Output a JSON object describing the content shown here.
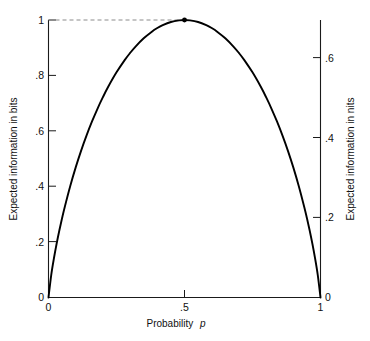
{
  "chart_data": {
    "type": "line",
    "title": "",
    "subtitle": "",
    "xlabel": "Probability p",
    "ylabel": "Expected information in bits",
    "y2label": "Expected information in nits",
    "xlim": [
      0,
      1
    ],
    "ylim": [
      0,
      1
    ],
    "y2lim": [
      0,
      0.6931
    ],
    "grid": false,
    "legend": null,
    "x_ticks": [
      {
        "value": 0,
        "label": "0"
      },
      {
        "value": 0.5,
        "label": ".5"
      },
      {
        "value": 1,
        "label": "1"
      }
    ],
    "y_ticks": [
      {
        "value": 0,
        "label": "0"
      },
      {
        "value": 0.2,
        "label": ".2"
      },
      {
        "value": 0.4,
        "label": ".4"
      },
      {
        "value": 0.6,
        "label": ".6"
      },
      {
        "value": 0.8,
        "label": ".8"
      },
      {
        "value": 1.0,
        "label": "1"
      }
    ],
    "y2_ticks": [
      {
        "value": 0,
        "label": "0"
      },
      {
        "value": 0.2,
        "label": ".2"
      },
      {
        "value": 0.4,
        "label": ".4"
      },
      {
        "value": 0.6,
        "label": ".6"
      }
    ],
    "series": [
      {
        "name": "Binary entropy H(p)",
        "x": [
          0.0,
          0.01,
          0.02,
          0.03,
          0.04,
          0.05,
          0.06,
          0.08,
          0.1,
          0.12,
          0.14,
          0.16,
          0.18,
          0.2,
          0.22,
          0.25,
          0.28,
          0.3,
          0.32,
          0.35,
          0.38,
          0.4,
          0.42,
          0.45,
          0.48,
          0.5,
          0.52,
          0.55,
          0.58,
          0.6,
          0.62,
          0.65,
          0.68,
          0.7,
          0.72,
          0.75,
          0.78,
          0.8,
          0.82,
          0.84,
          0.86,
          0.88,
          0.9,
          0.92,
          0.94,
          0.95,
          0.96,
          0.97,
          0.98,
          0.99,
          1.0
        ],
        "y": [
          0.0,
          0.0808,
          0.1414,
          0.1944,
          0.2423,
          0.2864,
          0.3274,
          0.4022,
          0.469,
          0.5294,
          0.5842,
          0.6343,
          0.6801,
          0.7219,
          0.7602,
          0.8113,
          0.8555,
          0.8813,
          0.9044,
          0.9341,
          0.958,
          0.971,
          0.9815,
          0.9928,
          0.9988,
          1.0,
          0.9988,
          0.9928,
          0.9815,
          0.971,
          0.958,
          0.9341,
          0.9044,
          0.8813,
          0.8555,
          0.8113,
          0.7602,
          0.7219,
          0.6801,
          0.6343,
          0.5842,
          0.5294,
          0.469,
          0.4022,
          0.3274,
          0.2864,
          0.2423,
          0.1944,
          0.1414,
          0.0808,
          0.0
        ]
      }
    ],
    "annotations": [
      {
        "name": "peak-marker",
        "x": 0.5,
        "y": 1.0,
        "label": ""
      },
      {
        "name": "peak-guide-line",
        "from": [
          0.0,
          1.0
        ],
        "to": [
          0.5,
          1.0
        ],
        "style": "dashed"
      }
    ]
  },
  "axes": {
    "left": {
      "title": "Expected information in bits",
      "tick_labels": [
        "0",
        ".2",
        ".4",
        ".6",
        ".8",
        "1"
      ]
    },
    "right": {
      "title": "Expected information in nits",
      "tick_labels": [
        "0",
        ".2",
        ".4",
        ".6"
      ]
    },
    "bottom": {
      "title_prefix": "Probability",
      "title_variable": "p",
      "tick_labels": [
        "0",
        ".5",
        "1"
      ]
    }
  },
  "colors": {
    "curve": "#000000",
    "axis": "#1a1a1a",
    "guide": "#8c8c8c",
    "background": "#ffffff"
  }
}
